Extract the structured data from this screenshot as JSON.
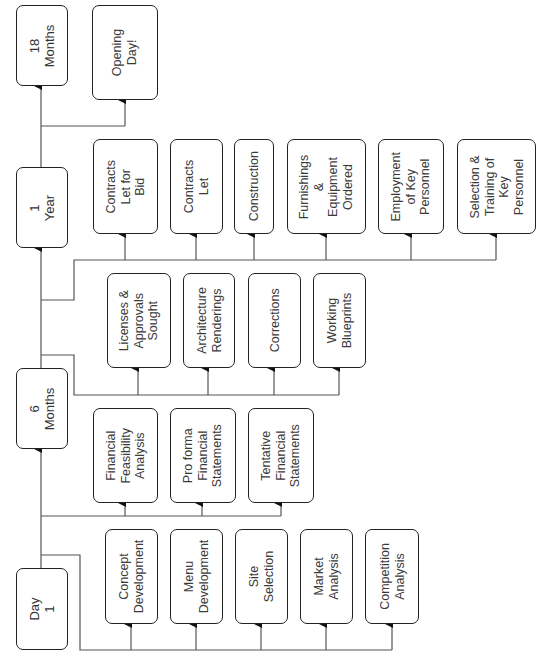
{
  "diagram": {
    "orientation": "rotated-90-ccw",
    "line_color": "#555555",
    "box_border_color": "#222222",
    "text_color": "#3a3a3a",
    "milestones": [
      {
        "id": "day1",
        "label": "Day\n1"
      },
      {
        "id": "6months",
        "label": "6\nMonths"
      },
      {
        "id": "1year",
        "label": "1\nYear"
      },
      {
        "id": "18months",
        "label": "18\nMonths"
      }
    ],
    "groups": {
      "day1_tasks": [
        {
          "label": "Concept\nDevelopment"
        },
        {
          "label": "Menu\nDevelopment"
        },
        {
          "label": "Site\nSelection"
        },
        {
          "label": "Market\nAnalysis"
        },
        {
          "label": "Competition\nAnalysis"
        }
      ],
      "financial_tasks": [
        {
          "label": "Financial\nFeasibility\nAnalysis"
        },
        {
          "label": "Pro forma\nFinancial\nStatements"
        },
        {
          "label": "Tentative\nFinancial\nStatements"
        }
      ],
      "six_month_tasks": [
        {
          "label": "Licenses &\nApprovals\nSought"
        },
        {
          "label": "Architecture\nRenderings"
        },
        {
          "label": "Corrections"
        },
        {
          "label": "Working\nBlueprints"
        }
      ],
      "one_year_tasks": [
        {
          "label": "Contracts\nLet for\nBid"
        },
        {
          "label": "Contracts\nLet"
        },
        {
          "label": "Construction"
        },
        {
          "label": "Furnishings\n&\nEquipment\nOrdered"
        },
        {
          "label": "Employment\nof Key\nPersonnel"
        },
        {
          "label": "Selection &\nTraining of\nKey\nPersonnel"
        }
      ],
      "opening_tasks": [
        {
          "label": "Opening\nDay!"
        }
      ]
    }
  }
}
